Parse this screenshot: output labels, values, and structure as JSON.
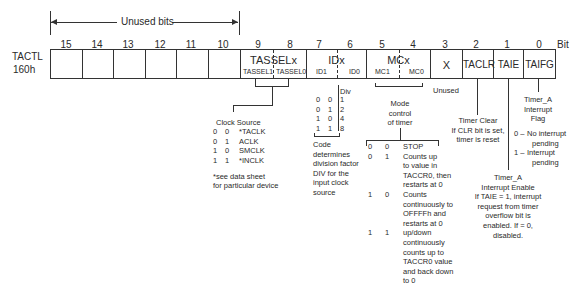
{
  "register": {
    "name": "TACTL",
    "address": "160h",
    "bit_label": "Bit",
    "unused_bits_label": "Unused bits",
    "bit_numbers": [
      "15",
      "14",
      "13",
      "12",
      "11",
      "10",
      "9",
      "8",
      "7",
      "6",
      "5",
      "4",
      "3",
      "2",
      "1",
      "0"
    ],
    "fields": {
      "tassel": {
        "name": "TASSELx",
        "sub1": "TASSEL1",
        "sub0": "TASSEL0"
      },
      "id": {
        "name": "IDx",
        "sub1": "ID1",
        "sub0": "ID0"
      },
      "mc": {
        "name": "MCx",
        "sub1": "MC1",
        "sub0": "MC0"
      },
      "x": {
        "name": "X"
      },
      "taclr": {
        "name": "TACLR"
      },
      "taie": {
        "name": "TAIE"
      },
      "taifg": {
        "name": "TAIFG"
      }
    }
  },
  "clock_source": {
    "title": "Clock Source",
    "rows": [
      {
        "b1": "0",
        "b0": "0",
        "value": "*TACLK"
      },
      {
        "b1": "0",
        "b0": "1",
        "value": "ACLK"
      },
      {
        "b1": "1",
        "b0": "0",
        "value": "SMCLK"
      },
      {
        "b1": "1",
        "b0": "1",
        "value": "*INCLK"
      }
    ],
    "note_line1": "*see data sheet",
    "note_line2": "for particular device"
  },
  "divider": {
    "header": "Div",
    "rows": [
      {
        "b1": "0",
        "b0": "0",
        "value": "1"
      },
      {
        "b1": "0",
        "b0": "1",
        "value": "2"
      },
      {
        "b1": "1",
        "b0": "0",
        "value": "4"
      },
      {
        "b1": "1",
        "b0": "1",
        "value": "8"
      }
    ],
    "description": [
      "Code",
      "determines",
      "division factor",
      "DIV for the",
      "input clock",
      "source"
    ]
  },
  "mode_control": {
    "title": [
      "Mode",
      "control",
      "of timer"
    ],
    "rows": [
      {
        "b1": "0",
        "b0": "0",
        "lines": [
          "STOP"
        ]
      },
      {
        "b1": "0",
        "b0": "1",
        "lines": [
          "Counts up",
          "to value in",
          "TACCR0, then",
          "restarts at 0"
        ]
      },
      {
        "b1": "1",
        "b0": "0",
        "lines": [
          "Counts",
          "continuously to",
          "OFFFFh and",
          "restarts at 0"
        ]
      },
      {
        "b1": "1",
        "b0": "1",
        "lines": [
          "up/down",
          "continuously",
          "counts up to",
          "TACCR0 value",
          "and back down",
          "to 0"
        ]
      }
    ]
  },
  "unused_label": "Unused",
  "timer_clear": [
    "Timer Clear",
    "If CLR bit is set,",
    "timer is reset"
  ],
  "interrupt_flag": {
    "title": [
      "Timer_A",
      "Interrupt",
      "Flag"
    ],
    "opt0_code": "0 –",
    "opt0_lines": [
      "No interrupt",
      "pending"
    ],
    "opt1_code": "1 –",
    "opt1_lines": [
      "Interrupt",
      "pending"
    ]
  },
  "interrupt_enable": [
    "Timer_A",
    "Interrupt Enable",
    "If TAIE = 1, interrupt",
    "request from timer",
    "overflow bit is",
    "enabled. If = 0,",
    "disabled."
  ]
}
